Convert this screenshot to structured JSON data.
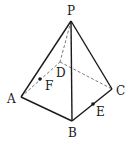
{
  "figure": {
    "type": "pyramid",
    "points": {
      "P": {
        "x": 71,
        "y": 21
      },
      "A": {
        "x": 21,
        "y": 97
      },
      "B": {
        "x": 72,
        "y": 121
      },
      "C": {
        "x": 112,
        "y": 89
      },
      "D": {
        "x": 60,
        "y": 62
      },
      "F": {
        "x": 40,
        "y": 79
      },
      "E": {
        "x": 93,
        "y": 104
      }
    },
    "labels": {
      "P": "P",
      "A": "A",
      "B": "B",
      "C": "C",
      "D": "D",
      "E": "E",
      "F": "F"
    },
    "solid_edges": [
      [
        "P",
        "A"
      ],
      [
        "P",
        "B"
      ],
      [
        "P",
        "C"
      ],
      [
        "A",
        "B"
      ],
      [
        "B",
        "C"
      ]
    ],
    "dashed_edges": [
      [
        "P",
        "D"
      ],
      [
        "A",
        "D"
      ],
      [
        "D",
        "C"
      ]
    ],
    "marked_points": [
      "E",
      "F"
    ],
    "colors": {
      "line": "#1a1a1a",
      "dashed": "#7a7a7a",
      "background": "#ffffff"
    }
  }
}
